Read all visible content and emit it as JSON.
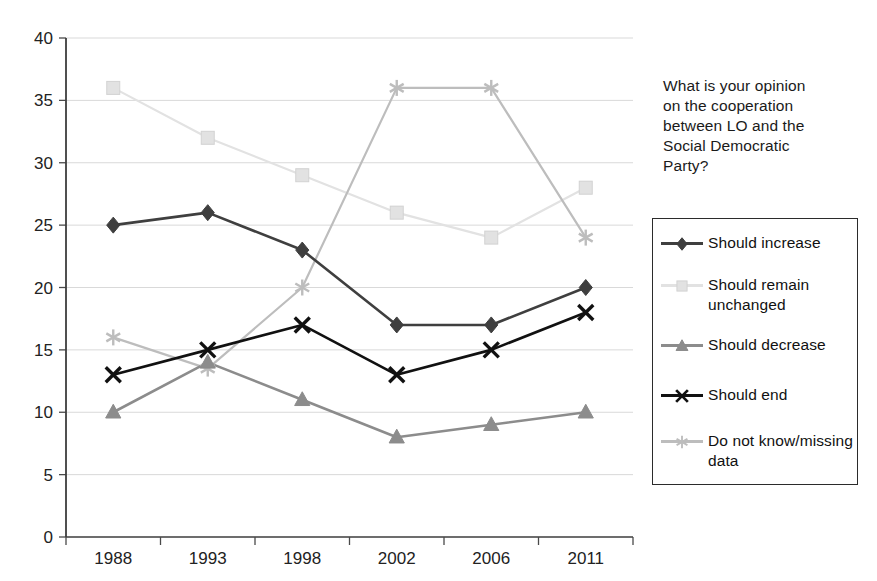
{
  "chart_data": {
    "type": "line",
    "title": "",
    "xlabel": "",
    "ylabel": "",
    "categories": [
      "1988",
      "1993",
      "1998",
      "2002",
      "2006",
      "2011"
    ],
    "ylim": [
      0,
      40
    ],
    "ytick_step": 5,
    "yticks": [
      "0",
      "5",
      "10",
      "15",
      "20",
      "25",
      "30",
      "35",
      "40"
    ],
    "grid": true,
    "legend_position": "right",
    "legend_title": "What is your opinion on the cooperation between LO and the Social Democratic Party?",
    "series": [
      {
        "name": "Should increase",
        "marker": "diamond",
        "color": "#3f3f3f",
        "values": [
          25,
          26,
          23,
          17,
          17,
          20
        ]
      },
      {
        "name": "Should remain unchanged",
        "marker": "square",
        "color": "#e2e2e2",
        "values": [
          36,
          32,
          29,
          26,
          24,
          28
        ]
      },
      {
        "name": "Should decrease",
        "marker": "triangle",
        "color": "#8c8c8c",
        "values": [
          10,
          14,
          11,
          8,
          9,
          10
        ]
      },
      {
        "name": "Should end",
        "marker": "cross",
        "color": "#111111",
        "values": [
          13,
          15,
          17,
          13,
          15,
          18
        ]
      },
      {
        "name": "Do not know/missing data",
        "marker": "asterisk",
        "color": "#bdbdbd",
        "values": [
          16,
          13.5,
          20,
          36,
          36,
          24
        ]
      }
    ]
  },
  "legend": {
    "title_lines": [
      "What is your opinion",
      "on the cooperation",
      "between LO and the",
      "Social Democratic",
      "Party?"
    ],
    "items": [
      {
        "label": "Should increase",
        "marker": "diamond",
        "color": "#3f3f3f"
      },
      {
        "label": "Should remain unchanged",
        "marker": "square",
        "color": "#e2e2e2"
      },
      {
        "label": "Should decrease",
        "marker": "triangle",
        "color": "#8c8c8c"
      },
      {
        "label": "Should end",
        "marker": "cross",
        "color": "#111111"
      },
      {
        "label": "Do not know/missing data",
        "marker": "asterisk",
        "color": "#bdbdbd"
      }
    ]
  },
  "colors": {
    "background": "#ffffff",
    "axis": "#4a4a4a",
    "grid": "#d9d9d9",
    "text": "#1a1a1a",
    "legend_border": "#2b2b2b"
  }
}
